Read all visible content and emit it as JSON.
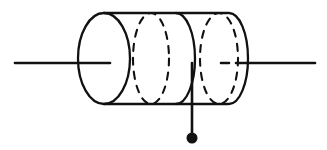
{
  "figure": {
    "title": "",
    "kind": "line-drawing",
    "background_color": "#ffffff",
    "stroke_color": "#111111",
    "canvas": {
      "width": 327,
      "height": 150
    }
  },
  "geometry": {
    "body": {
      "top_line": {
        "x1": 104,
        "y1": 13,
        "x2": 228,
        "y2": 13
      },
      "bottom_line": {
        "x1": 104,
        "y1": 104,
        "x2": 228,
        "y2": 104
      }
    },
    "rings": [
      {
        "name": "front-face-ellipse",
        "cx": 104,
        "cy": 58.5,
        "rx": 26,
        "ry": 45.5,
        "style": "solid",
        "full": true
      },
      {
        "name": "hidden-turn-ellipse-1",
        "cx": 151,
        "cy": 58.5,
        "rx": 18,
        "ry": 45.5,
        "style": "dashed",
        "full": true
      },
      {
        "name": "visible-turn-ellipse-1",
        "cx": 176,
        "cy": 58.5,
        "rx": 19,
        "ry": 45.5,
        "style": "solid-front-half",
        "full": false
      },
      {
        "name": "hidden-turn-ellipse-2",
        "cx": 219,
        "cy": 58.5,
        "rx": 19,
        "ry": 45.5,
        "style": "dashed",
        "full": true
      },
      {
        "name": "back-face-ellipse",
        "cx": 229,
        "cy": 58.5,
        "rx": 19,
        "ry": 45.5,
        "style": "solid-right-half",
        "full": false
      }
    ],
    "leads": [
      {
        "name": "left-lead",
        "style": "solid",
        "x1": 15,
        "y1": 63,
        "x2": 110,
        "y2": 63
      },
      {
        "name": "right-lead-hidden-segment",
        "style": "dashed",
        "x1": 221,
        "y1": 63,
        "x2": 242,
        "y2": 63
      },
      {
        "name": "right-lead",
        "style": "solid",
        "x1": 243,
        "y1": 63,
        "x2": 315,
        "y2": 63
      },
      {
        "name": "center-tap-lead",
        "style": "solid",
        "x1": 192,
        "y1": 63,
        "x2": 192,
        "y2": 136
      }
    ],
    "terminal_dot": {
      "cx": 192,
      "cy": 138,
      "r": 5.5
    }
  },
  "labels": {
    "items": []
  }
}
